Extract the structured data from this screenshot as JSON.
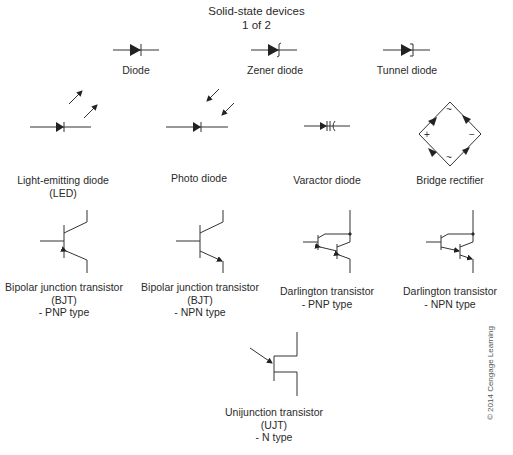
{
  "title": {
    "line1": "Solid-state devices",
    "line2": "1 of 2"
  },
  "symbols": [
    {
      "id": "diode",
      "lines": [
        "Diode"
      ]
    },
    {
      "id": "zener",
      "lines": [
        "Zener diode"
      ]
    },
    {
      "id": "tunnel",
      "lines": [
        "Tunnel diode"
      ]
    },
    {
      "id": "led",
      "lines": [
        "Light-emitting diode",
        "(LED)"
      ]
    },
    {
      "id": "photo",
      "lines": [
        "Photo diode"
      ]
    },
    {
      "id": "varactor",
      "lines": [
        "Varactor diode"
      ]
    },
    {
      "id": "bridge",
      "lines": [
        "Bridge rectifier"
      ]
    },
    {
      "id": "bjt_pnp",
      "lines": [
        "Bipolar junction transistor",
        "(BJT)",
        "- PNP type"
      ]
    },
    {
      "id": "bjt_npn",
      "lines": [
        "Bipolar junction transistor",
        "(BJT)",
        "- NPN type"
      ]
    },
    {
      "id": "darl_pnp",
      "lines": [
        "Darlington transistor",
        "- PNP type"
      ]
    },
    {
      "id": "darl_npn",
      "lines": [
        "Darlington transistor",
        "- NPN type"
      ]
    },
    {
      "id": "ujt",
      "lines": [
        "Unijunction transistor",
        "(UJT)",
        "- N type"
      ]
    }
  ],
  "bridge_marks": {
    "plus": "+",
    "minus": "−",
    "ac": "~"
  },
  "copyright": "© 2014 Cengage Learning"
}
